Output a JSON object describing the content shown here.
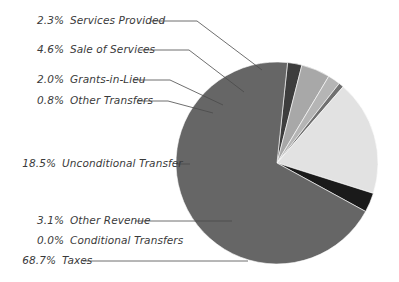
{
  "chart_data": {
    "type": "pie",
    "title": "",
    "subtitle": "",
    "xlabel": "",
    "ylabel": "",
    "legend_position": "callout-labels-left",
    "grid": false,
    "units": "percent",
    "total": 100.0,
    "categories": [
      "Services Provided",
      "Sale of Services",
      "Grants-in-Lieu",
      "Other Transfers",
      "Unconditional Transfer",
      "Other Revenue",
      "Conditional Transfers",
      "Taxes"
    ],
    "values": [
      2.3,
      4.6,
      2.0,
      0.8,
      18.5,
      3.1,
      0.0,
      68.7
    ],
    "slices": [
      {
        "label": "Services Provided",
        "percent_text": "2.3%",
        "value": 2.3,
        "color": "#3d3d3d",
        "label_x": 24,
        "label_y": 14,
        "leader": "M 150 21 L 197 21 L 262 70"
      },
      {
        "label": "Sale of Services",
        "percent_text": "4.6%",
        "value": 4.6,
        "color": "#a8a8a8",
        "label_x": 24,
        "label_y": 43,
        "leader": "M 139 50 L 189 50 L 244 92"
      },
      {
        "label": "Grants-in-Lieu",
        "percent_text": "2.0%",
        "value": 2.0,
        "color": "#b5b5b5",
        "label_x": 24,
        "label_y": 73,
        "leader": "M 133 80 L 170 80 L 223 105"
      },
      {
        "label": "Other Transfers",
        "percent_text": "0.8%",
        "value": 0.8,
        "color": "#707070",
        "label_x": 24,
        "label_y": 94,
        "leader": "M 137 101 L 168 101 L 213 113"
      },
      {
        "label": "Unconditional Transfer",
        "percent_text": "18.5%",
        "value": 18.5,
        "color": "#e2e2e2",
        "label_x": 16,
        "label_y": 157,
        "leader": "M 176 164 L 190 164"
      },
      {
        "label": "Other Revenue",
        "percent_text": "3.1%",
        "value": 3.1,
        "color": "#1a1a1a",
        "label_x": 24,
        "label_y": 214,
        "leader": "M 135 221 L 232 221"
      },
      {
        "label": "Conditional Transfers",
        "percent_text": "0.0%",
        "value": 0.0,
        "color": "#8a8a8a",
        "label_x": 24,
        "label_y": 234,
        "leader": ""
      },
      {
        "label": "Taxes",
        "percent_text": "68.7%",
        "value": 68.7,
        "color": "#666666",
        "label_x": 16,
        "label_y": 254,
        "leader": "M 83 261 L 248 261"
      }
    ],
    "geometry": {
      "center_x": 277,
      "center_y": 163,
      "radius": 101,
      "start_angle_deg": -84
    }
  }
}
